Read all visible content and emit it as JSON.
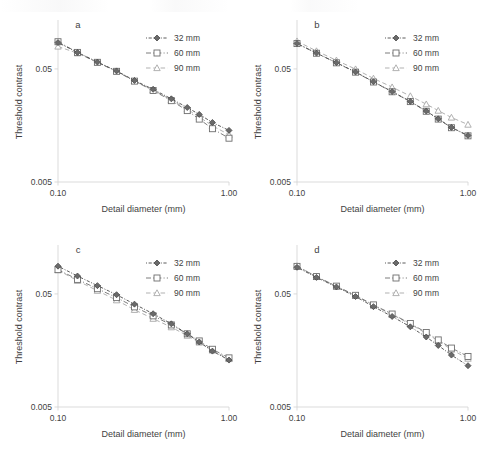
{
  "figure": {
    "panels": [
      "a",
      "b",
      "c",
      "d"
    ],
    "axis": {
      "xlabel": "Detail diameter (mm)",
      "ylabel": "Threshold contrast",
      "xticks": [
        "0.10",
        "1.00"
      ],
      "yticks": [
        "0.005",
        "0.05"
      ]
    },
    "legend": {
      "entries": [
        {
          "label": "32 mm",
          "marker": "diamond-marker",
          "style": "dotted-dashed",
          "color": "#4a4a4a"
        },
        {
          "label": "60 mm",
          "marker": "square-marker",
          "style": "dash-dot",
          "color": "#6e6e6e"
        },
        {
          "label": "90 mm",
          "marker": "triangle-marker",
          "style": "long-dash",
          "color": "#a8a8a8"
        }
      ]
    }
  },
  "chart_data": [
    {
      "type": "line",
      "panel": "a",
      "title": "a",
      "xlabel": "Detail diameter (mm)",
      "ylabel": "Threshold contrast",
      "xscale": "log",
      "yscale": "log",
      "xlim": [
        0.1,
        1.0
      ],
      "ylim": [
        0.005,
        0.13
      ],
      "xticks": [
        0.1,
        1.0
      ],
      "xticklabels": [
        "0.10",
        "1.00"
      ],
      "yticks": [
        0.005,
        0.05
      ],
      "yticklabels": [
        "0.005",
        "0.05"
      ],
      "grid": false,
      "legend_position": "top-right",
      "x": [
        0.1,
        0.13,
        0.17,
        0.22,
        0.28,
        0.36,
        0.46,
        0.57,
        0.67,
        0.8,
        1.0
      ],
      "series": [
        {
          "name": "32 mm",
          "values": [
            0.0855,
            0.07,
            0.0575,
            0.048,
            0.0395,
            0.033,
            0.0272,
            0.0228,
            0.0198,
            0.0168,
            0.0143
          ]
        },
        {
          "name": "60 mm",
          "values": [
            0.087,
            0.07,
            0.0572,
            0.0476,
            0.039,
            0.0322,
            0.0262,
            0.0214,
            0.018,
            0.0148,
            0.0122
          ]
        },
        {
          "name": "90 mm",
          "values": [
            0.079,
            0.0688,
            0.057,
            0.0478,
            0.0392,
            0.0325,
            0.0266,
            0.022,
            0.0188,
            0.0157,
            0.0131
          ]
        }
      ]
    },
    {
      "type": "line",
      "panel": "b",
      "title": "b",
      "xlabel": "Detail diameter (mm)",
      "ylabel": "Threshold contrast",
      "xscale": "log",
      "yscale": "log",
      "xlim": [
        0.1,
        1.0
      ],
      "ylim": [
        0.005,
        0.13
      ],
      "xticks": [
        0.1,
        1.0
      ],
      "xticklabels": [
        "0.10",
        "1.00"
      ],
      "yticks": [
        0.005,
        0.05
      ],
      "yticklabels": [
        "0.005",
        "0.05"
      ],
      "grid": false,
      "legend_position": "top-right",
      "x": [
        0.1,
        0.13,
        0.17,
        0.22,
        0.28,
        0.36,
        0.46,
        0.57,
        0.67,
        0.8,
        1.0
      ],
      "series": [
        {
          "name": "32 mm",
          "values": [
            0.084,
            0.069,
            0.0568,
            0.047,
            0.0385,
            0.0315,
            0.0258,
            0.0212,
            0.0181,
            0.0152,
            0.0129
          ]
        },
        {
          "name": "60 mm",
          "values": [
            0.0838,
            0.0688,
            0.0566,
            0.0468,
            0.0383,
            0.0314,
            0.0257,
            0.0211,
            0.018,
            0.0151,
            0.0128
          ]
        },
        {
          "name": "90 mm",
          "values": [
            0.088,
            0.072,
            0.0596,
            0.0498,
            0.0412,
            0.0345,
            0.0288,
            0.0244,
            0.0214,
            0.0186,
            0.0161
          ]
        }
      ]
    },
    {
      "type": "line",
      "panel": "c",
      "title": "c",
      "xlabel": "Detail diameter (mm)",
      "ylabel": "Threshold contrast",
      "xscale": "log",
      "yscale": "log",
      "xlim": [
        0.1,
        1.0
      ],
      "ylim": [
        0.005,
        0.13
      ],
      "xticks": [
        0.1,
        1.0
      ],
      "xticklabels": [
        "0.10",
        "1.00"
      ],
      "yticks": [
        0.005,
        0.05
      ],
      "yticklabels": [
        "0.005",
        "0.05"
      ],
      "grid": false,
      "legend_position": "top-right",
      "x": [
        0.1,
        0.13,
        0.17,
        0.22,
        0.28,
        0.36,
        0.46,
        0.57,
        0.67,
        0.8,
        1.0
      ],
      "series": [
        {
          "name": "32 mm",
          "values": [
            0.088,
            0.072,
            0.0592,
            0.0492,
            0.0406,
            0.0334,
            0.0272,
            0.0222,
            0.0188,
            0.0156,
            0.013
          ]
        },
        {
          "name": "60 mm",
          "values": [
            0.082,
            0.0672,
            0.0556,
            0.0464,
            0.0384,
            0.032,
            0.0266,
            0.0222,
            0.0192,
            0.0162,
            0.0136
          ]
        },
        {
          "name": "90 mm",
          "values": [
            0.0812,
            0.0654,
            0.0534,
            0.044,
            0.0362,
            0.0302,
            0.0254,
            0.0214,
            0.0186,
            0.0158,
            0.0133
          ]
        }
      ]
    },
    {
      "type": "line",
      "panel": "d",
      "title": "d",
      "xlabel": "Detail diameter (mm)",
      "ylabel": "Threshold contrast",
      "xscale": "log",
      "yscale": "log",
      "xlim": [
        0.1,
        1.0
      ],
      "ylim": [
        0.005,
        0.13
      ],
      "xticks": [
        0.1,
        1.0
      ],
      "xticklabels": [
        "0.10",
        "1.00"
      ],
      "yticks": [
        0.005,
        0.05
      ],
      "yticklabels": [
        "0.005",
        "0.05"
      ],
      "grid": false,
      "legend_position": "top-right",
      "x": [
        0.1,
        0.13,
        0.17,
        0.22,
        0.28,
        0.36,
        0.46,
        0.57,
        0.67,
        0.8,
        1.0
      ],
      "series": [
        {
          "name": "32 mm",
          "values": [
            0.086,
            0.07,
            0.0576,
            0.0474,
            0.0386,
            0.0316,
            0.0256,
            0.0208,
            0.0175,
            0.0144,
            0.0116
          ]
        },
        {
          "name": "60 mm",
          "values": [
            0.0876,
            0.0712,
            0.0586,
            0.0486,
            0.04,
            0.0332,
            0.0274,
            0.0228,
            0.0196,
            0.0166,
            0.014
          ]
        },
        {
          "name": "90 mm",
          "values": [
            0.0884,
            0.071,
            0.0582,
            0.0482,
            0.0396,
            0.0328,
            0.027,
            0.0224,
            0.0192,
            0.0161,
            0.0134
          ]
        }
      ]
    }
  ]
}
